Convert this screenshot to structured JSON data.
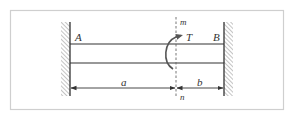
{
  "diagram": {
    "type": "shaft fixed at both ends with applied torque",
    "labels": {
      "left_end": "A",
      "right_end": "B",
      "torque": "T",
      "section_top": "m",
      "section_bottom": "n",
      "dim_left": "a",
      "dim_right": "b"
    },
    "colors": {
      "frame": "#c8c8c8",
      "line": "#333333",
      "hatch": "#888888",
      "dashed": "#666666",
      "background": "#ffffff"
    }
  }
}
